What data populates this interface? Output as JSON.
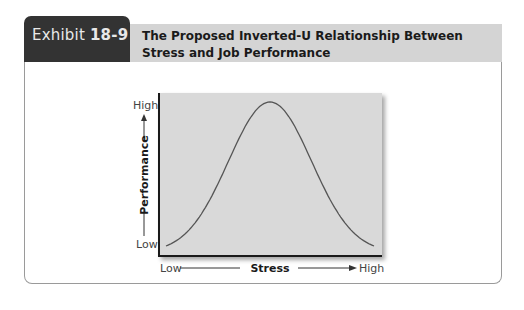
{
  "exhibit": {
    "label": "Exhibit",
    "number": "18-9",
    "title": "The Proposed Inverted-U Relationship Between Stress and Job Performance"
  },
  "colors": {
    "tab_bg": "#333333",
    "title_bar_bg": "#d4d4d4",
    "plot_bg": "#d9d9d9",
    "curve": "#555555",
    "axis": "#1a1a1a"
  },
  "chart_data": {
    "type": "line",
    "title": "The Proposed Inverted-U Relationship Between Stress and Job Performance",
    "xlabel": "Stress",
    "ylabel": "Performance",
    "x_tick_labels": [
      "Low",
      "High"
    ],
    "y_tick_labels": [
      "Low",
      "High"
    ],
    "x": [
      0,
      0.1,
      0.2,
      0.3,
      0.4,
      0.5,
      0.6,
      0.7,
      0.8,
      0.9,
      1.0
    ],
    "series": [
      {
        "name": "Performance",
        "values": [
          0.05,
          0.12,
          0.3,
          0.6,
          0.88,
          0.97,
          0.88,
          0.6,
          0.3,
          0.12,
          0.05
        ]
      }
    ],
    "xlim": [
      0,
      1
    ],
    "ylim": [
      0,
      1
    ],
    "grid": false,
    "legend": null,
    "shape": "inverted-U (bell curve)"
  }
}
